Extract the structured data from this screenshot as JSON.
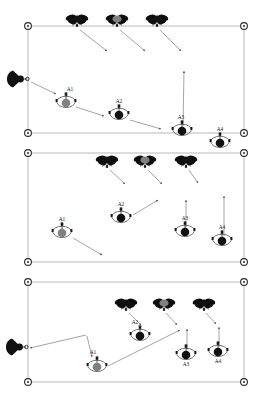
{
  "figure": {
    "type": "technical-diagram",
    "width": 272,
    "height": 415,
    "background": "#ffffff",
    "panel_count": 3
  },
  "style": {
    "arena_border_color": "#b8b8b8",
    "corner_marker_color": "#2b2b2b",
    "trajectory_color": "#8d8d8d",
    "robot_black": "#111111",
    "robot_gray": "#808080",
    "label_color": "#1a1a1a"
  },
  "legend_semantics": {
    "quadcopter": "aerial-drone-icon",
    "ground_robot": "ground-robot-icon",
    "dish": "radar-dish-icon",
    "corner": "arena-corner-marker",
    "arrow": "trajectory-arrow"
  },
  "panels": [
    {
      "id": "panel-1",
      "index": 1,
      "name": "stage-1",
      "arena": {
        "x": 28,
        "y": 26,
        "w": 216,
        "h": 107
      },
      "corners": [
        {
          "name": "corner-top-left",
          "x": 28,
          "y": 26
        },
        {
          "name": "corner-top-right",
          "x": 244,
          "y": 26
        },
        {
          "name": "corner-bottom-left",
          "x": 28,
          "y": 133
        },
        {
          "name": "corner-bottom-right",
          "x": 244,
          "y": 133
        }
      ],
      "dish": {
        "name": "radar-dish",
        "x": 19,
        "y": 79,
        "color": "#111111"
      },
      "drones": [
        {
          "name": "drone-1",
          "x": 77,
          "y": 19,
          "color": "#111111"
        },
        {
          "name": "drone-2",
          "x": 117,
          "y": 19,
          "color": "#808080"
        },
        {
          "name": "drone-3",
          "x": 157,
          "y": 19,
          "color": "#111111"
        }
      ],
      "robots": [
        {
          "name": "ground-robot-a1",
          "label": "A1",
          "x": 66,
          "y": 103,
          "color": "#808080",
          "label_dx": 4,
          "label_dy": -12
        },
        {
          "name": "ground-robot-a2",
          "label": "A2",
          "x": 119,
          "y": 115,
          "color": "#111111",
          "label_dx": 0,
          "label_dy": -12
        },
        {
          "name": "ground-robot-a3",
          "label": "A3",
          "x": 182,
          "y": 131,
          "color": "#111111",
          "label_dx": -1,
          "label_dy": -12
        },
        {
          "name": "ground-robot-a4",
          "label": "A4",
          "x": 220,
          "y": 143,
          "color": "#111111",
          "label_dx": 0,
          "label_dy": -12
        }
      ],
      "trajectories": [
        {
          "name": "traj-drone1-down",
          "x1": 80,
          "y1": 30,
          "x2": 107,
          "y2": 51
        },
        {
          "name": "traj-drone2-down",
          "x1": 120,
          "y1": 30,
          "x2": 145,
          "y2": 51
        },
        {
          "name": "traj-drone3-down",
          "x1": 160,
          "y1": 30,
          "x2": 181,
          "y2": 51
        },
        {
          "name": "traj-dish-to-a1",
          "x1": 31,
          "y1": 82,
          "x2": 56,
          "y2": 94
        },
        {
          "name": "traj-a1-to-a2",
          "x1": 76,
          "y1": 107,
          "x2": 104,
          "y2": 116
        },
        {
          "name": "traj-a2-to-a3",
          "x1": 130,
          "y1": 120,
          "x2": 161,
          "y2": 129
        },
        {
          "name": "traj-a3-mast",
          "x1": 183,
          "y1": 126,
          "x2": 184,
          "y2": 71
        }
      ]
    },
    {
      "id": "panel-2",
      "index": 2,
      "name": "stage-2",
      "arena": {
        "x": 28,
        "y": 153,
        "w": 216,
        "h": 109
      },
      "corners": [
        {
          "name": "corner-top-left",
          "x": 28,
          "y": 153
        },
        {
          "name": "corner-top-right",
          "x": 244,
          "y": 153
        },
        {
          "name": "corner-bottom-left",
          "x": 28,
          "y": 262
        },
        {
          "name": "corner-bottom-right",
          "x": 244,
          "y": 262
        }
      ],
      "dish": null,
      "drones": [
        {
          "name": "drone-1",
          "x": 107,
          "y": 160,
          "color": "#111111"
        },
        {
          "name": "drone-2",
          "x": 145,
          "y": 160,
          "color": "#808080"
        },
        {
          "name": "drone-3",
          "x": 186,
          "y": 160,
          "color": "#111111"
        }
      ],
      "robots": [
        {
          "name": "ground-robot-a1",
          "label": "A1",
          "x": 62,
          "y": 233,
          "color": "#808080",
          "label_dx": 0,
          "label_dy": -12
        },
        {
          "name": "ground-robot-a2",
          "label": "A2",
          "x": 121,
          "y": 218,
          "color": "#111111",
          "label_dx": 0,
          "label_dy": -12
        },
        {
          "name": "ground-robot-a3",
          "label": "A3",
          "x": 185,
          "y": 232,
          "color": "#111111",
          "label_dx": 0,
          "label_dy": -12
        },
        {
          "name": "ground-robot-a4",
          "label": "A4",
          "x": 222,
          "y": 241,
          "color": "#111111",
          "label_dx": 0,
          "label_dy": -12
        }
      ],
      "trajectories": [
        {
          "name": "traj-drone1-down",
          "x1": 110,
          "y1": 170,
          "x2": 125,
          "y2": 184
        },
        {
          "name": "traj-drone2-down",
          "x1": 148,
          "y1": 170,
          "x2": 162,
          "y2": 184
        },
        {
          "name": "traj-drone3-down",
          "x1": 189,
          "y1": 170,
          "x2": 198,
          "y2": 183
        },
        {
          "name": "traj-a2-up-right",
          "x1": 133,
          "y1": 215,
          "x2": 158,
          "y2": 200
        },
        {
          "name": "traj-a1-down-right",
          "x1": 73,
          "y1": 238,
          "x2": 102,
          "y2": 255
        },
        {
          "name": "traj-a3-mast",
          "x1": 186,
          "y1": 228,
          "x2": 186,
          "y2": 200
        },
        {
          "name": "traj-a4-mast",
          "x1": 224,
          "y1": 236,
          "x2": 224,
          "y2": 196
        }
      ]
    },
    {
      "id": "panel-3",
      "index": 3,
      "name": "stage-3",
      "arena": {
        "x": 28,
        "y": 282,
        "w": 216,
        "h": 100
      },
      "corners": [
        {
          "name": "corner-top-left",
          "x": 28,
          "y": 282
        },
        {
          "name": "corner-top-right",
          "x": 244,
          "y": 282
        },
        {
          "name": "corner-bottom-left",
          "x": 28,
          "y": 382
        },
        {
          "name": "corner-bottom-right",
          "x": 244,
          "y": 382
        }
      ],
      "dish": {
        "name": "radar-dish",
        "x": 18,
        "y": 347,
        "color": "#111111"
      },
      "drones": [
        {
          "name": "drone-1",
          "x": 126,
          "y": 303,
          "color": "#111111"
        },
        {
          "name": "drone-2",
          "x": 164,
          "y": 303,
          "color": "#808080"
        },
        {
          "name": "drone-3",
          "x": 204,
          "y": 303,
          "color": "#111111"
        }
      ],
      "robots": [
        {
          "name": "ground-robot-a1",
          "label": "A1",
          "x": 97,
          "y": 367,
          "color": "#808080",
          "label_dx": -4,
          "label_dy": -13
        },
        {
          "name": "ground-robot-a2",
          "label": "A2",
          "x": 140,
          "y": 336,
          "color": "#111111",
          "label_dx": -5,
          "label_dy": -12
        },
        {
          "name": "ground-robot-a3",
          "label": "A3",
          "x": 186,
          "y": 355,
          "color": "#111111",
          "label_dx": 0,
          "label_dy": 11
        },
        {
          "name": "ground-robot-a4",
          "label": "A4",
          "x": 218,
          "y": 352,
          "color": "#111111",
          "label_dx": 0,
          "label_dy": 11
        }
      ],
      "trajectories": [
        {
          "name": "traj-drone1-to-a2",
          "x1": 129,
          "y1": 313,
          "x2": 141,
          "y2": 325
        },
        {
          "name": "traj-drone2-down",
          "x1": 166,
          "y1": 313,
          "x2": 177,
          "y2": 325
        },
        {
          "name": "traj-drone3-down",
          "x1": 206,
          "y1": 313,
          "x2": 216,
          "y2": 324
        },
        {
          "name": "traj-waypoint-to-dish",
          "x1": 86,
          "y1": 335,
          "x2": 30,
          "y2": 348
        },
        {
          "name": "traj-waypoint-down-to-a1",
          "x1": 87,
          "y1": 336,
          "x2": 92,
          "y2": 357
        },
        {
          "name": "traj-long-diagonal",
          "x1": 108,
          "y1": 366,
          "x2": 180,
          "y2": 330
        },
        {
          "name": "traj-a3-mast",
          "x1": 187,
          "y1": 350,
          "x2": 187,
          "y2": 329
        },
        {
          "name": "traj-a4-mast",
          "x1": 219,
          "y1": 347,
          "x2": 219,
          "y2": 327
        }
      ]
    }
  ]
}
